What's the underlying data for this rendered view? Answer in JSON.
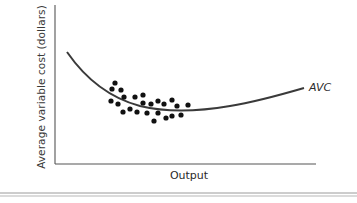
{
  "figure": {
    "y_axis_label": "Average variable cost (dollars)",
    "x_axis_label": "Output",
    "curve_label": "AVC",
    "colors": {
      "axis": "#555555",
      "curve": "#3a3a3a",
      "dots": "#111111",
      "rule": "#9a9a9a"
    }
  },
  "chart_data": {
    "type": "scatter",
    "title": "",
    "xlabel": "Output",
    "ylabel": "Average variable cost (dollars)",
    "grid": false,
    "legend": null,
    "annotations": [
      "AVC"
    ],
    "series": [
      {
        "name": "AVC curve (fitted)",
        "kind": "line",
        "points_px": [
          [
            67,
            52
          ],
          [
            80,
            70
          ],
          [
            100,
            88
          ],
          [
            120,
            101
          ],
          [
            150,
            109
          ],
          [
            180,
            111
          ],
          [
            230,
            106
          ],
          [
            270,
            98
          ],
          [
            303,
            89
          ]
        ]
      },
      {
        "name": "Observations",
        "kind": "scatter",
        "points_px": [
          [
            115,
            83
          ],
          [
            112,
            89
          ],
          [
            121,
            90
          ],
          [
            124,
            97
          ],
          [
            135,
            97
          ],
          [
            143,
            95
          ],
          [
            111,
            101
          ],
          [
            118,
            104
          ],
          [
            143,
            103
          ],
          [
            151,
            104
          ],
          [
            158,
            101
          ],
          [
            164,
            104
          ],
          [
            172,
            100
          ],
          [
            177,
            106
          ],
          [
            188,
            105
          ],
          [
            123,
            112
          ],
          [
            130,
            109
          ],
          [
            137,
            112
          ],
          [
            147,
            113
          ],
          [
            158,
            113
          ],
          [
            166,
            118
          ],
          [
            172,
            116
          ],
          [
            181,
            115
          ],
          [
            154,
            121
          ]
        ]
      }
    ],
    "axes_px": {
      "origin": [
        55,
        164
      ],
      "x_end": [
        316,
        164
      ],
      "y_end": [
        55,
        5
      ]
    }
  }
}
